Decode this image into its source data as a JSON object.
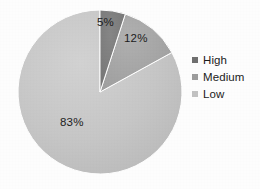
{
  "chart_data": {
    "type": "pie",
    "title": "",
    "categories": [
      "High",
      "Medium",
      "Low"
    ],
    "values": [
      5,
      12,
      83
    ],
    "value_labels": [
      "5%",
      "12%",
      "83%"
    ],
    "unit": "%",
    "legend_position": "right",
    "start_angle_deg": 0,
    "direction": "clockwise",
    "grid": false,
    "colors": [
      "#7d7d7d",
      "#a6a6a6",
      "#c4c4c4"
    ],
    "slices": [
      {
        "name": "High",
        "label": "5%",
        "value": 5,
        "color": "#7d7d7d"
      },
      {
        "name": "Medium",
        "label": "12%",
        "value": 12,
        "color": "#a6a6a6"
      },
      {
        "name": "Low",
        "label": "83%",
        "value": 83,
        "color": "#c4c4c4"
      }
    ]
  },
  "legend": {
    "items": [
      {
        "label": "High",
        "color": "#6f6f6f"
      },
      {
        "label": "Medium",
        "color": "#9d9d9d"
      },
      {
        "label": "Low",
        "color": "#c2c2c2"
      }
    ]
  },
  "geometry": {
    "center_x": 100,
    "center_y": 92,
    "radius": 82
  },
  "palette": {
    "background": "#fdfdfd",
    "text": "#1b1b1b",
    "slice_high": "#7d7d7d",
    "slice_medium": "#a6a6a6",
    "slice_low": "#c4c4c4",
    "outline": "#ffffff"
  }
}
